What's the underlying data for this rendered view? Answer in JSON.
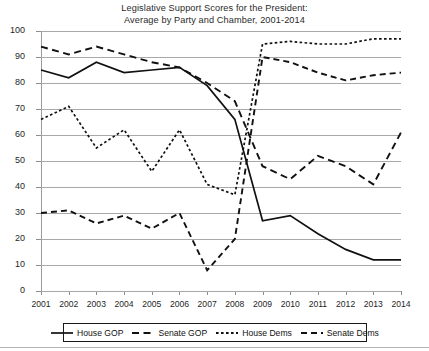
{
  "chart_data": {
    "type": "line",
    "title": "Legislative Support Scores for the President:",
    "subtitle": "Average by Party and Chamber, 2001-2014",
    "title_lines": [
      "Legislative Support Scores for the President:",
      "Average by Party and Chamber, 2001-2014"
    ],
    "xlabel": "",
    "ylabel": "",
    "xlim": [
      2001,
      2014
    ],
    "ylim": [
      0,
      100
    ],
    "ytick_step": 10,
    "grid": "horizontal",
    "legend_position": "bottom",
    "categories": [
      2001,
      2002,
      2003,
      2004,
      2005,
      2006,
      2007,
      2008,
      2009,
      2010,
      2011,
      2012,
      2013,
      2014
    ],
    "x_tick_labels": [
      "2001",
      "2002",
      "2003",
      "2004",
      "2005",
      "2006",
      "2007",
      "2008",
      "2009",
      "2010",
      "2011",
      "2012",
      "2013",
      "2014"
    ],
    "y_tick_labels": [
      "0",
      "10",
      "20",
      "30",
      "40",
      "50",
      "60",
      "70",
      "80",
      "90",
      "100"
    ],
    "y_ticks": [
      0,
      10,
      20,
      30,
      40,
      50,
      60,
      70,
      80,
      90,
      100
    ],
    "series": [
      {
        "name": "House GOP",
        "style": "solid",
        "color": "#111111",
        "values": [
          85,
          82,
          88,
          84,
          85,
          86,
          79,
          66,
          27,
          29,
          22,
          16,
          12,
          12
        ]
      },
      {
        "name": "Senate GOP",
        "style": "dashed",
        "color": "#111111",
        "values": [
          94,
          91,
          94,
          91,
          88,
          86,
          80,
          73,
          48,
          43,
          52,
          48,
          41,
          61
        ]
      },
      {
        "name": "House Dems",
        "style": "dash-dot",
        "color": "#111111",
        "values": [
          66,
          71,
          55,
          62,
          46,
          62,
          41,
          37,
          95,
          96,
          95,
          95,
          97,
          97
        ]
      },
      {
        "name": "Senate Dems",
        "style": "dotted",
        "color": "#111111",
        "values": [
          30,
          31,
          26,
          29,
          24,
          30,
          8,
          20,
          90,
          88,
          84,
          81,
          83,
          84
        ]
      }
    ]
  },
  "legend": {
    "items": [
      {
        "label": "House GOP",
        "style": "solid"
      },
      {
        "label": "Senate GOP",
        "style": "dashed"
      },
      {
        "label": "House Dems",
        "style": "dash-dot"
      },
      {
        "label": "Senate Dems",
        "style": "dotted"
      }
    ]
  }
}
